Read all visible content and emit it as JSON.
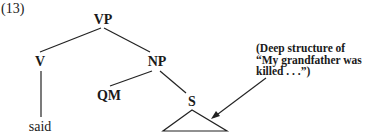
{
  "example_number": "(13)",
  "tree": {
    "root": "VP",
    "nodes": {
      "vp": "VP",
      "v": "V",
      "np": "NP",
      "qm": "QM",
      "s": "S",
      "said": "said"
    },
    "edges": [
      [
        "VP",
        "V"
      ],
      [
        "VP",
        "NP"
      ],
      [
        "V",
        "said"
      ],
      [
        "NP",
        "QM"
      ],
      [
        "NP",
        "S"
      ],
      [
        "S",
        "triangle"
      ]
    ]
  },
  "annotation": {
    "lines": [
      "(Deep structure of",
      "“My grandfather was",
      "killed . . .”)"
    ],
    "points_to": "S"
  }
}
